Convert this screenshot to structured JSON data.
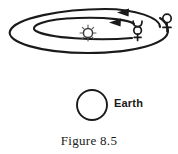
{
  "figure": {
    "caption": "Figure 8.5",
    "background_color": "#ffffff",
    "stroke_color": "#1a1a1a"
  },
  "diagram": {
    "type": "orbital-diagram",
    "sun": {
      "name": "sun-symbol",
      "glyph": "☉",
      "center_x": 88,
      "center_y": 33,
      "radius": 5,
      "ray_count": 8
    },
    "orbits": [
      {
        "name": "mercury-orbit",
        "planet": "Mercury",
        "cx": 74,
        "cy": 33,
        "rx": 62,
        "ry": 19,
        "direction": "counterclockwise",
        "arrow_label": "direction-of-motion"
      },
      {
        "name": "venus-orbit",
        "planet": "Venus",
        "cx": 88,
        "cy": 33,
        "rx": 84,
        "ry": 27,
        "direction": "counterclockwise",
        "arrow_label": "direction-of-motion"
      }
    ],
    "planets": [
      {
        "name": "mercury-symbol",
        "label": "Mercury",
        "glyph": "☿",
        "x": 138,
        "y": 30
      },
      {
        "name": "venus-symbol",
        "label": "Venus",
        "glyph": "♀",
        "x": 167,
        "y": 22
      }
    ],
    "earth": {
      "name": "earth-body",
      "label": "Earth",
      "center_x": 92,
      "center_y": 105,
      "radius": 15
    },
    "arrows": [
      {
        "name": "venus-orbit-arrow",
        "tip_x": 120,
        "tip_y": 13,
        "points": "left"
      },
      {
        "name": "mercury-orbit-arrow",
        "tip_x": 112,
        "tip_y": 23,
        "points": "left"
      }
    ]
  }
}
